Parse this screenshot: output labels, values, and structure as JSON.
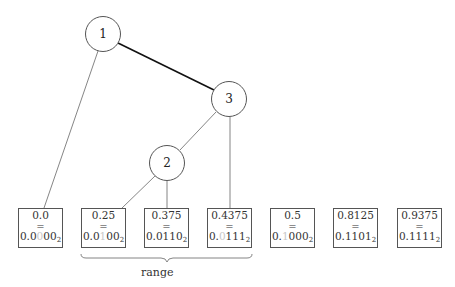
{
  "tree": {
    "nodes": [
      {
        "id": "1",
        "label": "1",
        "cx": 103,
        "cy": 34
      },
      {
        "id": "3",
        "label": "3",
        "cx": 229,
        "cy": 99
      },
      {
        "id": "2",
        "label": "2",
        "cx": 167,
        "cy": 163
      }
    ],
    "edges": [
      {
        "from": "1",
        "to": "3",
        "bold": true
      },
      {
        "from": "1",
        "to": "leaf0"
      },
      {
        "from": "3",
        "to": "2"
      },
      {
        "from": "3",
        "to": "leaf3"
      },
      {
        "from": "2",
        "to": "leaf1"
      },
      {
        "from": "2",
        "to": "leaf2"
      }
    ]
  },
  "leaves": [
    {
      "decimal": "0.0",
      "eq": "=",
      "bin_a": "0.0",
      "bin_faint": "0",
      "bin_b": "00",
      "base": "2"
    },
    {
      "decimal": "0.25",
      "eq": "=",
      "bin_a": "0.0",
      "bin_faint": "1",
      "bin_b": "00",
      "base": "2"
    },
    {
      "decimal": "0.375",
      "eq": "=",
      "bin_a": "0.0110",
      "bin_faint": "",
      "bin_b": "",
      "base": "2"
    },
    {
      "decimal": "0.4375",
      "eq": "=",
      "bin_a": "0.",
      "bin_faint": "0",
      "bin_b": "111",
      "base": "2"
    },
    {
      "decimal": "0.5",
      "eq": "=",
      "bin_a": "0.",
      "bin_faint": "1",
      "bin_b": "000",
      "base": "2"
    },
    {
      "decimal": "0.8125",
      "eq": "=",
      "bin_a": "0.1101",
      "bin_faint": "",
      "bin_b": "",
      "base": "2"
    },
    {
      "decimal": "0.9375",
      "eq": "=",
      "bin_a": "0.1111",
      "bin_faint": "",
      "bin_b": "",
      "base": "2"
    }
  ],
  "brace": {
    "label": "range"
  }
}
